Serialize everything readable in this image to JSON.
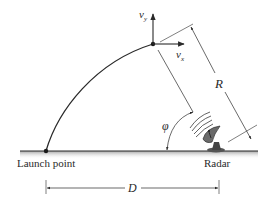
{
  "diagram": {
    "labels": {
      "vy": "v",
      "vy_sub": "y",
      "vx": "v",
      "vx_sub": "x",
      "range": "R",
      "angle": "φ",
      "distance": "D",
      "launch_point": "Launch point",
      "radar": "Radar"
    },
    "colors": {
      "line": "#2a2a2a",
      "ground_shadow": "#b8b8b8",
      "text": "#2a2a2a"
    }
  }
}
